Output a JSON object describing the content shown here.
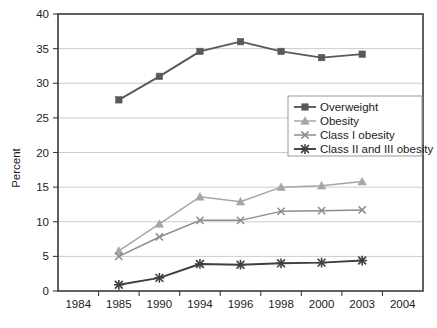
{
  "chart_data": {
    "type": "line",
    "title": "",
    "subtitle": "",
    "xlabel": "",
    "ylabel": "Percent",
    "ylim": [
      0,
      40
    ],
    "ytick_step": 5,
    "yticks": [
      "0",
      "5",
      "10",
      "15",
      "20",
      "25",
      "30",
      "35",
      "40"
    ],
    "categories": [
      "1984",
      "1985",
      "1990",
      "1994",
      "1996",
      "1998",
      "2000",
      "2003",
      "2004"
    ],
    "grid": "horizontal",
    "legend_position": "center-right",
    "series": [
      {
        "name": "Overweight",
        "marker": "square",
        "color": "#595959",
        "x": [
          "1985",
          "1990",
          "1994",
          "1996",
          "1998",
          "2000",
          "2003"
        ],
        "values": [
          27.6,
          31.0,
          34.6,
          36.0,
          34.6,
          33.7,
          34.2
        ]
      },
      {
        "name": "Obesity",
        "marker": "triangle",
        "color": "#a6a6a6",
        "x": [
          "1985",
          "1990",
          "1994",
          "1996",
          "1998",
          "2000",
          "2003"
        ],
        "values": [
          5.8,
          9.7,
          13.6,
          12.9,
          15.0,
          15.2,
          15.8
        ]
      },
      {
        "name": "Class I obesity",
        "marker": "cross",
        "color": "#8c8c8c",
        "x": [
          "1985",
          "1990",
          "1994",
          "1996",
          "1998",
          "2000",
          "2003"
        ],
        "values": [
          5.0,
          7.8,
          10.2,
          10.2,
          11.5,
          11.6,
          11.7
        ]
      },
      {
        "name": "Class II  and  III obesity",
        "marker": "star",
        "color": "#3f3f3f",
        "x": [
          "1985",
          "1990",
          "1994",
          "1996",
          "1998",
          "2000",
          "2003"
        ],
        "values": [
          0.9,
          1.9,
          3.9,
          3.8,
          4.0,
          4.1,
          4.4
        ]
      }
    ]
  },
  "legend": {
    "items": [
      {
        "label": "Overweight"
      },
      {
        "label": "Obesity"
      },
      {
        "label": "Class I obesity"
      },
      {
        "label": "Class II  and  III obesity"
      }
    ]
  },
  "axes": {
    "y_title": "Percent"
  }
}
